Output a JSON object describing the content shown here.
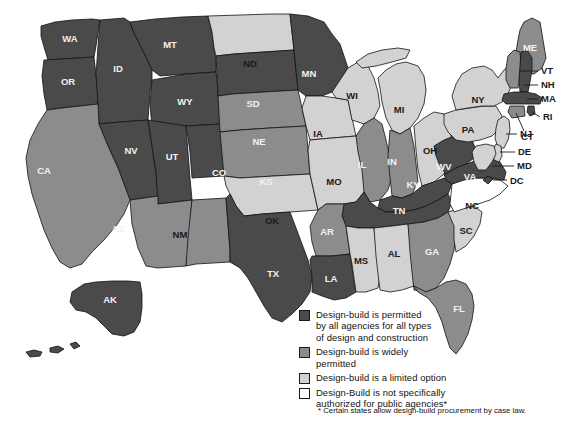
{
  "figure": {
    "type": "choropleth-map"
  },
  "legend": {
    "items": [
      {
        "color": "#4a4a4a",
        "label": "Design-build is permitted\nby all agencies for all types\nof design and construction",
        "key": "permitted-all"
      },
      {
        "color": "#8c8c8c",
        "label": "Design-build is widely\npermitted",
        "key": "widely-permitted"
      },
      {
        "color": "#d2d2d2",
        "label": "Design-build is a limited option",
        "key": "limited-option"
      },
      {
        "color": "#ffffff",
        "label": "Design-Build is not specifically\nauthorized for public agencies*",
        "key": "not-authorized"
      }
    ]
  },
  "footnote": "* Certain states allow design-build procurement by case law.",
  "colors": {
    "permitted_all": "#4a4a4a",
    "widely_permitted": "#8c8c8c",
    "limited_option": "#d2d2d2",
    "not_authorized": "#ffffff",
    "border": "#111111",
    "background": "#ffffff"
  },
  "chart_data": {
    "type": "heatmap",
    "categories": [
      "permitted-all",
      "widely-permitted",
      "limited-option",
      "not-authorized"
    ],
    "states": [
      {
        "code": "WA",
        "category": "permitted-all",
        "labelfill": "light"
      },
      {
        "code": "OR",
        "category": "permitted-all",
        "labelfill": "light"
      },
      {
        "code": "ID",
        "category": "permitted-all",
        "labelfill": "light"
      },
      {
        "code": "MT",
        "category": "permitted-all",
        "labelfill": "light"
      },
      {
        "code": "WY",
        "category": "permitted-all",
        "labelfill": "light"
      },
      {
        "code": "NV",
        "category": "permitted-all",
        "labelfill": "light"
      },
      {
        "code": "UT",
        "category": "permitted-all",
        "labelfill": "light"
      },
      {
        "code": "CA",
        "category": "widely-permitted",
        "labelfill": "light"
      },
      {
        "code": "AZ",
        "category": "widely-permitted",
        "labelfill": "light"
      },
      {
        "code": "NM",
        "category": "widely-permitted",
        "labelfill": "dark"
      },
      {
        "code": "CO",
        "category": "permitted-all",
        "labelfill": "light"
      },
      {
        "code": "ND",
        "category": "limited-option",
        "labelfill": "dark"
      },
      {
        "code": "SD",
        "category": "permitted-all",
        "labelfill": "light"
      },
      {
        "code": "NE",
        "category": "widely-permitted",
        "labelfill": "light"
      },
      {
        "code": "KS",
        "category": "widely-permitted",
        "labelfill": "light"
      },
      {
        "code": "OK",
        "category": "limited-option",
        "labelfill": "dark"
      },
      {
        "code": "TX",
        "category": "permitted-all",
        "labelfill": "light"
      },
      {
        "code": "MN",
        "category": "permitted-all",
        "labelfill": "light"
      },
      {
        "code": "IA",
        "category": "limited-option",
        "labelfill": "dark"
      },
      {
        "code": "MO",
        "category": "limited-option",
        "labelfill": "dark"
      },
      {
        "code": "AR",
        "category": "widely-permitted",
        "labelfill": "light"
      },
      {
        "code": "LA",
        "category": "permitted-all",
        "labelfill": "light"
      },
      {
        "code": "WI",
        "category": "limited-option",
        "labelfill": "dark"
      },
      {
        "code": "IL",
        "category": "widely-permitted",
        "labelfill": "light"
      },
      {
        "code": "MI",
        "category": "limited-option",
        "labelfill": "dark"
      },
      {
        "code": "IN",
        "category": "widely-permitted",
        "labelfill": "light"
      },
      {
        "code": "OH",
        "category": "limited-option",
        "labelfill": "dark"
      },
      {
        "code": "KY",
        "category": "permitted-all",
        "labelfill": "light"
      },
      {
        "code": "TN",
        "category": "permitted-all",
        "labelfill": "light"
      },
      {
        "code": "MS",
        "category": "limited-option",
        "labelfill": "dark"
      },
      {
        "code": "AL",
        "category": "limited-option",
        "labelfill": "dark"
      },
      {
        "code": "GA",
        "category": "widely-permitted",
        "labelfill": "light"
      },
      {
        "code": "FL",
        "category": "widely-permitted",
        "labelfill": "light"
      },
      {
        "code": "SC",
        "category": "limited-option",
        "labelfill": "dark"
      },
      {
        "code": "NC",
        "category": "not-authorized",
        "labelfill": "dark"
      },
      {
        "code": "VA",
        "category": "permitted-all",
        "labelfill": "light"
      },
      {
        "code": "WV",
        "category": "permitted-all",
        "labelfill": "light"
      },
      {
        "code": "PA",
        "category": "limited-option",
        "labelfill": "dark"
      },
      {
        "code": "NY",
        "category": "limited-option",
        "labelfill": "dark"
      },
      {
        "code": "ME",
        "category": "widely-permitted",
        "labelfill": "light"
      },
      {
        "code": "VT",
        "category": "widely-permitted",
        "labelfill": "dark"
      },
      {
        "code": "NH",
        "category": "permitted-all",
        "labelfill": "dark"
      },
      {
        "code": "MA",
        "category": "permitted-all",
        "labelfill": "dark"
      },
      {
        "code": "RI",
        "category": "permitted-all",
        "labelfill": "dark"
      },
      {
        "code": "CT",
        "category": "widely-permitted",
        "labelfill": "dark"
      },
      {
        "code": "NJ",
        "category": "limited-option",
        "labelfill": "dark"
      },
      {
        "code": "DE",
        "category": "limited-option",
        "labelfill": "dark"
      },
      {
        "code": "MD",
        "category": "limited-option",
        "labelfill": "dark"
      },
      {
        "code": "DC",
        "category": "permitted-all",
        "labelfill": "dark"
      },
      {
        "code": "AK",
        "category": "permitted-all",
        "labelfill": "light"
      }
    ],
    "counts": {
      "permitted-all": 21,
      "widely-permitted": 11,
      "limited-option": 16,
      "not-authorized": 1
    },
    "callout_labels": [
      "VT",
      "NH",
      "MA",
      "RI",
      "CT",
      "NJ",
      "DE",
      "MD",
      "DC"
    ],
    "grid": false,
    "legend_position": "bottom-left"
  }
}
